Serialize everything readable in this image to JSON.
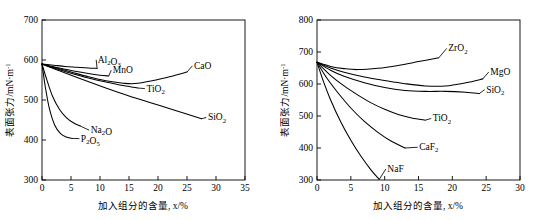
{
  "figure": {
    "panel_count": 2,
    "background_color": "#ffffff",
    "line_color": "#000000"
  },
  "chart_data": [
    {
      "type": "line",
      "panel": "left",
      "title": "",
      "xlabel": "加入组分的含量, x/%",
      "ylabel": "表面张力/mN·m",
      "ylabel_exponent": "-1",
      "xlim": [
        0,
        35
      ],
      "ylim": [
        300,
        700
      ],
      "xticks": [
        0,
        5,
        10,
        15,
        20,
        25,
        30,
        35
      ],
      "yticks": [
        300,
        400,
        500,
        600,
        700
      ],
      "grid": false,
      "legend": "inline-labels",
      "origin_value": 590,
      "series": [
        {
          "name": "Al2O3",
          "label": "Al₂O₃",
          "label_x": 9.6,
          "label_y": 593,
          "x": [
            0,
            2,
            4,
            6,
            8,
            9.5
          ],
          "values": [
            590,
            587,
            584,
            582,
            580,
            579
          ]
        },
        {
          "name": "MnO",
          "label": "MnO",
          "label_x": 12.2,
          "label_y": 567,
          "x": [
            0,
            2,
            4,
            6,
            8,
            10,
            11.5
          ],
          "values": [
            590,
            583,
            577,
            571,
            566,
            562,
            560
          ]
        },
        {
          "name": "CaO",
          "label": "CaO",
          "label_x": 26.2,
          "label_y": 578,
          "x": [
            0,
            2,
            5,
            8,
            11,
            14,
            16,
            19,
            22,
            25
          ],
          "values": [
            590,
            582,
            570,
            558,
            548,
            542,
            541,
            548,
            558,
            570
          ]
        },
        {
          "name": "TiO2",
          "label": "TiO₂",
          "label_x": 18.0,
          "label_y": 521,
          "x": [
            0,
            2,
            5,
            8,
            11,
            14,
            16.5
          ],
          "values": [
            590,
            580,
            567,
            555,
            545,
            536,
            530
          ]
        },
        {
          "name": "SiO2",
          "label": "SiO₂",
          "label_x": 28.6,
          "label_y": 449,
          "x": [
            0,
            3,
            7,
            11,
            15,
            19,
            23,
            27.5
          ],
          "values": [
            590,
            573,
            551,
            530,
            510,
            492,
            474,
            453
          ]
        },
        {
          "name": "Na2O",
          "label": "Na₂O",
          "label_x": 8.4,
          "label_y": 417,
          "x": [
            0,
            0.8,
            1.8,
            3,
            4.2,
            5.4,
            6.6
          ],
          "values": [
            590,
            552,
            510,
            477,
            456,
            443,
            435
          ]
        },
        {
          "name": "P2O5",
          "label": "P₂O₅",
          "label_x": 6.7,
          "label_y": 396,
          "x": [
            0,
            0.6,
            1.3,
            2.2,
            3.2,
            4.3,
            5.2
          ],
          "values": [
            590,
            530,
            477,
            437,
            416,
            407,
            404
          ]
        }
      ]
    },
    {
      "type": "line",
      "panel": "right",
      "title": "",
      "xlabel": "加入组分的含量, x/%",
      "ylabel": "表面张力/mN·m",
      "ylabel_exponent": "-1",
      "xlim": [
        0,
        30
      ],
      "ylim": [
        300,
        800
      ],
      "xticks": [
        0,
        5,
        10,
        15,
        20,
        25,
        30
      ],
      "yticks": [
        300,
        400,
        500,
        600,
        700,
        800
      ],
      "grid": false,
      "legend": "inline-labels",
      "origin_value": 668,
      "series": [
        {
          "name": "ZrO2",
          "label": "ZrO₂",
          "label_x": 19.4,
          "label_y": 702,
          "x": [
            0,
            2,
            4,
            6,
            9,
            12,
            15,
            18
          ],
          "values": [
            668,
            655,
            648,
            645,
            649,
            658,
            670,
            682
          ]
        },
        {
          "name": "MgO",
          "label": "MgO",
          "label_x": 25.6,
          "label_y": 628,
          "x": [
            0,
            2,
            4,
            7,
            10,
            13,
            16,
            19,
            22,
            24.5
          ],
          "values": [
            668,
            650,
            637,
            622,
            611,
            601,
            594,
            594,
            604,
            616
          ]
        },
        {
          "name": "SiO2",
          "label": "SiO₂",
          "label_x": 25.0,
          "label_y": 573,
          "x": [
            0,
            2,
            4,
            7,
            10,
            13,
            16,
            19,
            22,
            24
          ],
          "values": [
            668,
            643,
            624,
            604,
            589,
            580,
            577,
            577,
            574,
            570
          ]
        },
        {
          "name": "TiO2",
          "label": "TiO₂",
          "label_x": 17.1,
          "label_y": 483,
          "x": [
            0,
            2,
            4,
            6,
            8,
            10,
            12,
            14,
            16
          ],
          "values": [
            668,
            627,
            594,
            566,
            541,
            521,
            505,
            494,
            487
          ]
        },
        {
          "name": "CaF2",
          "label": "CaF₂",
          "label_x": 15.1,
          "label_y": 393,
          "x": [
            0,
            1.5,
            3,
            5,
            7,
            9,
            11,
            13
          ],
          "values": [
            668,
            617,
            575,
            525,
            483,
            449,
            421,
            400
          ]
        },
        {
          "name": "NaF",
          "label": "NaF",
          "label_x": 10.4,
          "label_y": 325,
          "x": [
            0,
            1,
            2,
            3.5,
            5,
            6.5,
            8,
            9.2
          ],
          "values": [
            668,
            605,
            551,
            482,
            424,
            374,
            331,
            302
          ]
        }
      ]
    }
  ]
}
